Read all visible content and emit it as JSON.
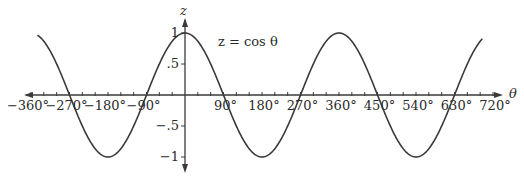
{
  "chart_data": {
    "type": "line",
    "title": "",
    "equation_label": "z = cos θ",
    "xlabel": "θ",
    "ylabel": "z",
    "x_ticks": [
      "−360°",
      "−270°",
      "−180°",
      "−90°",
      "90°",
      "180°",
      "270°",
      "360°",
      "450°",
      "540°",
      "630°",
      "720°"
    ],
    "x_tick_values": [
      -360,
      -270,
      -180,
      -90,
      90,
      180,
      270,
      360,
      450,
      540,
      630,
      720
    ],
    "y_ticks": [
      "1",
      ".5",
      "−.5",
      "−1"
    ],
    "y_tick_values": [
      1,
      0.5,
      -0.5,
      -1
    ],
    "xlim": [
      -370,
      730
    ],
    "ylim": [
      -1.2,
      1.2
    ],
    "grid": false,
    "series": [
      {
        "name": "z = cos θ",
        "function": "cos",
        "x_range": [
          -345,
          695
        ],
        "sample_points": {
          "x": [
            -360,
            -270,
            -180,
            -90,
            0,
            90,
            180,
            270,
            360,
            450,
            540,
            630,
            720
          ],
          "y": [
            1,
            0,
            -1,
            0,
            1,
            0,
            -1,
            0,
            1,
            0,
            -1,
            0,
            1
          ]
        }
      }
    ],
    "colors": {
      "line": "#3a3a3a",
      "axis": "#3a3a3a"
    }
  }
}
